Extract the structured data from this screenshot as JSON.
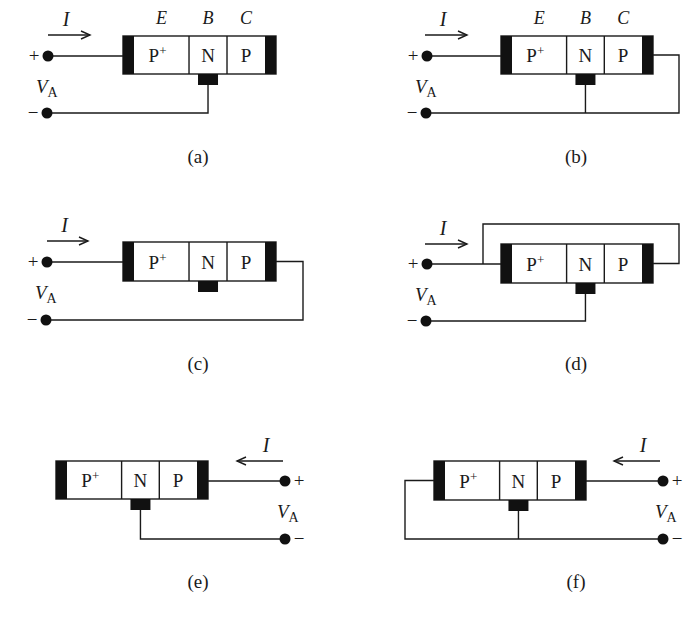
{
  "figure": {
    "regions": [
      "P+",
      "N",
      "P"
    ],
    "terminals": [
      "E",
      "B",
      "C"
    ],
    "current_label": "I",
    "voltage_label": "V",
    "voltage_subscript": "A",
    "plus": "+",
    "minus": "−",
    "colors": {
      "ink": "#1a1a1a",
      "background": "#ffffff"
    }
  },
  "panels": [
    {
      "id": "a",
      "caption": "(a)",
      "show_terminals": true,
      "box": {
        "x": 123,
        "y": 36,
        "w": 153,
        "h": 38
      },
      "source": {
        "side": "left",
        "plus": [
          48,
          56
        ],
        "minus": [
          47,
          113
        ]
      },
      "arrow": {
        "x1": 48,
        "x2": 90,
        "y": 35,
        "dir": "right"
      },
      "connection": "emitter-to-plus, base-to-minus, collector-open",
      "caption_pos": [
        198,
        163
      ]
    },
    {
      "id": "b",
      "caption": "(b)",
      "show_terminals": true,
      "box": {
        "x": 501,
        "y": 36,
        "w": 152,
        "h": 38
      },
      "source": {
        "side": "left",
        "plus": [
          427,
          56
        ],
        "minus": [
          426,
          113
        ]
      },
      "arrow": {
        "x1": 425,
        "x2": 467,
        "y": 35,
        "dir": "right"
      },
      "connection": "emitter-to-plus, base-and-collector-to-minus",
      "wire_x": 679,
      "caption_pos": [
        576,
        163
      ]
    },
    {
      "id": "c",
      "caption": "(c)",
      "show_terminals": false,
      "box": {
        "x": 123,
        "y": 242,
        "w": 153,
        "h": 39
      },
      "source": {
        "side": "left",
        "plus": [
          47,
          262
        ],
        "minus": [
          46,
          320
        ]
      },
      "arrow": {
        "x1": 47,
        "x2": 88,
        "y": 241,
        "dir": "right"
      },
      "connection": "emitter-to-plus, collector-to-minus, base-open",
      "wire_x": 303,
      "caption_pos": [
        198,
        370
      ]
    },
    {
      "id": "d",
      "caption": "(d)",
      "show_terminals": false,
      "box": {
        "x": 501,
        "y": 244,
        "w": 152,
        "h": 39
      },
      "source": {
        "side": "left",
        "plus": [
          427,
          264
        ],
        "minus": [
          426,
          321
        ]
      },
      "arrow": {
        "x1": 425,
        "x2": 467,
        "y": 244,
        "dir": "right"
      },
      "connection": "emitter-and-collector-to-plus, base-to-minus",
      "loop": {
        "x_left": 483,
        "x_right": 679,
        "y_top": 224
      },
      "caption_pos": [
        576,
        370
      ]
    },
    {
      "id": "e",
      "caption": "(e)",
      "show_terminals": false,
      "box": {
        "x": 56,
        "y": 461,
        "w": 152,
        "h": 38
      },
      "source": {
        "side": "right",
        "plus": [
          285,
          481
        ],
        "minus": [
          285,
          539
        ]
      },
      "arrow": {
        "x1": 283,
        "x2": 237,
        "y": 461,
        "dir": "left"
      },
      "connection": "collector-to-plus, base-to-minus, emitter-open",
      "caption_pos": [
        198,
        588
      ]
    },
    {
      "id": "f",
      "caption": "(f)",
      "show_terminals": false,
      "box": {
        "x": 434,
        "y": 461,
        "w": 152,
        "h": 39
      },
      "source": {
        "side": "right",
        "plus": [
          663,
          481
        ],
        "minus": [
          663,
          539
        ]
      },
      "arrow": {
        "x1": 660,
        "x2": 614,
        "y": 461,
        "dir": "left"
      },
      "connection": "collector-to-plus, base-and-emitter-to-minus",
      "wire_x": 405,
      "caption_pos": [
        576,
        588
      ]
    }
  ]
}
